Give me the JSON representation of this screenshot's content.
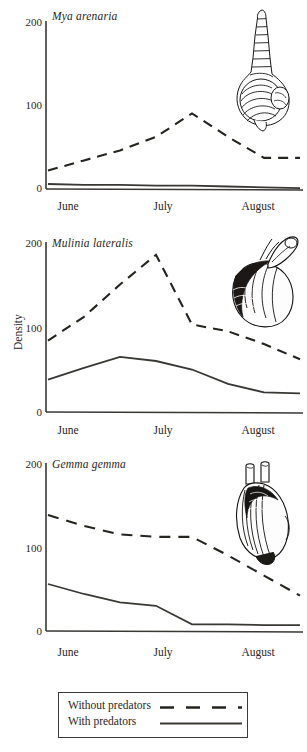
{
  "figure": {
    "ylabel": "Density",
    "legend": {
      "items": [
        {
          "label": "Without predators",
          "style": "dashed"
        },
        {
          "label": "With predators",
          "style": "solid"
        }
      ]
    }
  },
  "chart_data": [
    {
      "type": "line",
      "title": "Mya arenaria",
      "xlabel": "",
      "ylabel": "Density",
      "ylim": [
        0,
        200
      ],
      "yticks": [
        0,
        100,
        200
      ],
      "xticks": [
        "June",
        "July",
        "August"
      ],
      "grid": false,
      "legend_position": "below-figure",
      "illustration": "snail-shell-illustration",
      "x": [
        0,
        1,
        2,
        3,
        4,
        5,
        6,
        7
      ],
      "series": [
        {
          "name": "Without predators",
          "style": "dashed",
          "values": [
            22,
            34,
            46,
            62,
            90,
            62,
            37,
            37
          ]
        },
        {
          "name": "With predators",
          "style": "solid",
          "values": [
            6,
            5,
            5,
            4,
            4,
            3,
            2,
            1
          ]
        }
      ]
    },
    {
      "type": "line",
      "title": "Mulinia lateralis",
      "xlabel": "",
      "ylabel": "Density",
      "ylim": [
        0,
        200
      ],
      "yticks": [
        0,
        100,
        200
      ],
      "xticks": [
        "June",
        "July",
        "August"
      ],
      "grid": false,
      "legend_position": "below-figure",
      "illustration": "clam-with-siphon-illustration",
      "x": [
        0,
        1,
        2,
        3,
        4,
        5,
        6,
        7
      ],
      "series": [
        {
          "name": "Without predators",
          "style": "dashed",
          "values": [
            84,
            112,
            150,
            185,
            103,
            95,
            80,
            62
          ]
        },
        {
          "name": "With predators",
          "style": "solid",
          "values": [
            38,
            52,
            65,
            60,
            50,
            33,
            23,
            22
          ]
        }
      ]
    },
    {
      "type": "line",
      "title": "Gemma gemma",
      "xlabel": "",
      "ylabel": "Density",
      "ylim": [
        0,
        200
      ],
      "yticks": [
        0,
        100,
        200
      ],
      "xticks": [
        "June",
        "July",
        "August"
      ],
      "grid": false,
      "legend_position": "below-figure",
      "illustration": "gemma-clam-illustration",
      "x": [
        0,
        1,
        2,
        3,
        4,
        5,
        6,
        7
      ],
      "series": [
        {
          "name": "Without predators",
          "style": "dashed",
          "values": [
            138,
            125,
            115,
            112,
            112,
            90,
            66,
            42
          ]
        },
        {
          "name": "With predators",
          "style": "solid",
          "values": [
            56,
            44,
            34,
            30,
            8,
            8,
            7,
            7
          ]
        }
      ]
    }
  ]
}
